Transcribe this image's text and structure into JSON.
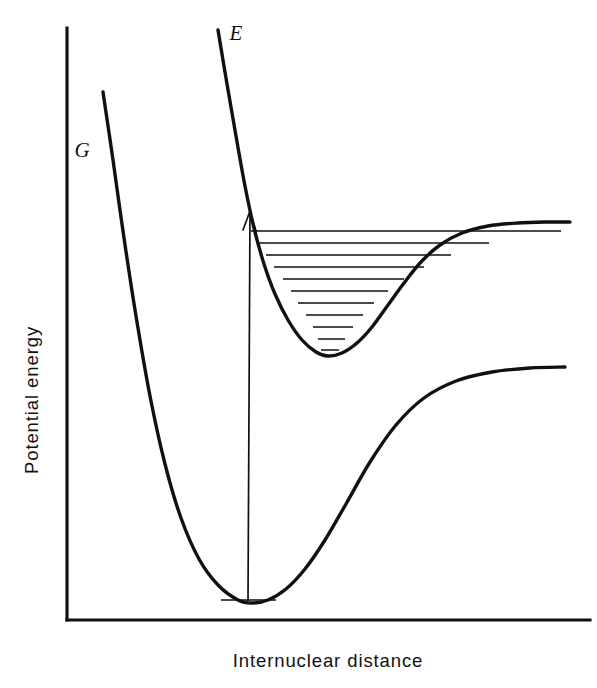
{
  "figure": {
    "kind": "potential-energy-curve-diagram",
    "background_color": "#ffffff",
    "line_color": "#111111",
    "axes": {
      "x_label": "Internuclear distance",
      "y_label": "Potential energy",
      "x_axis_shown": true,
      "y_axis_shown": true,
      "ticks_shown": false,
      "tick_labels": []
    },
    "labels": {
      "ground_state": "G",
      "excited_state": "E"
    }
  },
  "chart_data": {
    "type": "line",
    "title": "",
    "subtitle": "",
    "xlabel": "Internuclear distance",
    "ylabel": "Potential energy",
    "xlim": [
      0,
      1
    ],
    "ylim": [
      0,
      1
    ],
    "grid": false,
    "legend": "none",
    "axis_tick_labels": {
      "x": [],
      "y": []
    },
    "annotations": [
      {
        "name": "ground-state-label",
        "text": "G",
        "x_px": 82,
        "y_px": 157,
        "style": "italic"
      },
      {
        "name": "excited-state-label",
        "text": "E",
        "x_px": 236,
        "y_px": 40,
        "style": "italic"
      },
      {
        "name": "vertical-transition-arrow",
        "text": "",
        "from_x_px": 248,
        "from_y_px": 601,
        "to_x_px": 250,
        "to_y_px": 211,
        "description": "vertical Franck-Condon absorption arrow"
      }
    ],
    "series": [
      {
        "name": "G",
        "label": "G",
        "description": "ground state Morse potential curve",
        "dissociation_asymptote_y_px": 368,
        "minimum_x_px": 247,
        "minimum_y_px": 603,
        "path_points_px": [
          [
            103,
            92
          ],
          [
            113,
            160
          ],
          [
            124,
            238
          ],
          [
            136,
            316
          ],
          [
            150,
            396
          ],
          [
            165,
            464
          ],
          [
            181,
            518
          ],
          [
            199,
            559
          ],
          [
            218,
            585
          ],
          [
            238,
            600
          ],
          [
            252,
            603
          ],
          [
            268,
            600
          ],
          [
            286,
            589
          ],
          [
            305,
            569
          ],
          [
            325,
            540
          ],
          [
            346,
            504
          ],
          [
            370,
            462
          ],
          [
            396,
            425
          ],
          [
            424,
            398
          ],
          [
            456,
            381
          ],
          [
            492,
            372
          ],
          [
            530,
            368
          ],
          [
            565,
            367
          ]
        ]
      },
      {
        "name": "E",
        "label": "E",
        "description": "excited state Morse potential curve",
        "dissociation_asymptote_y_px": 222,
        "minimum_x_px": 325,
        "minimum_y_px": 356,
        "path_points_px": [
          [
            218,
            30
          ],
          [
            227,
            84
          ],
          [
            236,
            136
          ],
          [
            245,
            186
          ],
          [
            254,
            228
          ],
          [
            264,
            264
          ],
          [
            275,
            294
          ],
          [
            288,
            320
          ],
          [
            302,
            340
          ],
          [
            316,
            352
          ],
          [
            328,
            356
          ],
          [
            342,
            353
          ],
          [
            357,
            343
          ],
          [
            372,
            327
          ],
          [
            388,
            305
          ],
          [
            404,
            283
          ],
          [
            421,
            262
          ],
          [
            440,
            245
          ],
          [
            462,
            233
          ],
          [
            488,
            226
          ],
          [
            518,
            223
          ],
          [
            548,
            222
          ],
          [
            570,
            222
          ]
        ]
      }
    ],
    "vibrational_levels": {
      "state": "E",
      "count": 11,
      "description": "horizontal vibrational energy levels drawn inside the excited-state (E) well, widest at the top",
      "levels_px": [
        {
          "v": 10,
          "y": 231,
          "x_left": 251,
          "x_right": 561
        },
        {
          "v": 9,
          "y": 243,
          "x_left": 258,
          "x_right": 489
        },
        {
          "v": 8,
          "y": 255,
          "x_left": 266,
          "x_right": 451
        },
        {
          "v": 7,
          "y": 267,
          "x_left": 274,
          "x_right": 424
        },
        {
          "v": 6,
          "y": 279,
          "x_left": 283,
          "x_right": 404
        },
        {
          "v": 5,
          "y": 291,
          "x_left": 291,
          "x_right": 388
        },
        {
          "v": 4,
          "y": 303,
          "x_left": 298,
          "x_right": 374
        },
        {
          "v": 3,
          "y": 315,
          "x_left": 306,
          "x_right": 363
        },
        {
          "v": 2,
          "y": 327,
          "x_left": 313,
          "x_right": 353
        },
        {
          "v": 1,
          "y": 339,
          "x_left": 318,
          "x_right": 345
        },
        {
          "v": 0,
          "y": 350,
          "x_left": 321,
          "x_right": 339
        }
      ]
    },
    "ground_vibrational_level": {
      "state": "G",
      "v": 0,
      "y_px": 600,
      "x_left_px": 221,
      "x_right_px": 276
    }
  }
}
